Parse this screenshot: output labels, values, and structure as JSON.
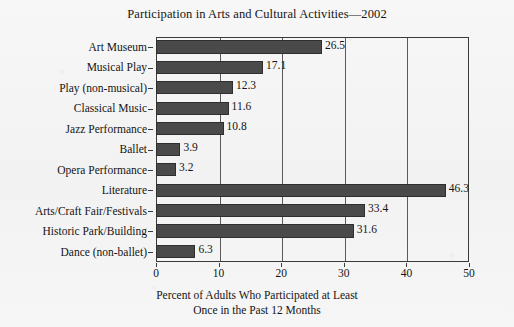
{
  "chart_data": {
    "type": "bar",
    "orientation": "horizontal",
    "title": "Participation in Arts and Cultural Activities—2002",
    "xlabel_line1": "Percent of Adults Who Participated at Least",
    "xlabel_line2": "Once in the Past 12 Months",
    "ylabel": "",
    "categories": [
      "Art Museum",
      "Musical Play",
      "Play (non-musical)",
      "Classical Music",
      "Jazz Performance",
      "Ballet",
      "Opera Performance",
      "Literature",
      "Arts/Craft Fair/Festivals",
      "Historic Park/Building",
      "Dance (non-ballet)"
    ],
    "values": [
      26.5,
      17.1,
      12.3,
      11.6,
      10.8,
      3.9,
      3.2,
      46.3,
      33.4,
      31.6,
      6.3
    ],
    "value_labels": [
      "26.5",
      "17.1",
      "12.3",
      "11.6",
      "10.8",
      "3.9",
      "3.2",
      "46.3",
      "33.4",
      "31.6",
      "6.3"
    ],
    "xlim": [
      0,
      50
    ],
    "xticks": [
      0,
      10,
      20,
      30,
      40,
      50
    ],
    "xtick_labels": [
      "0",
      "10",
      "20",
      "30",
      "40",
      "50"
    ],
    "grid": "vertical gridlines at 10, 20, 30, 40",
    "legend": "none",
    "bar_color": "#4a4a4a",
    "axis_color": "#3a3a3a",
    "background_color": "#f4f4f4"
  }
}
